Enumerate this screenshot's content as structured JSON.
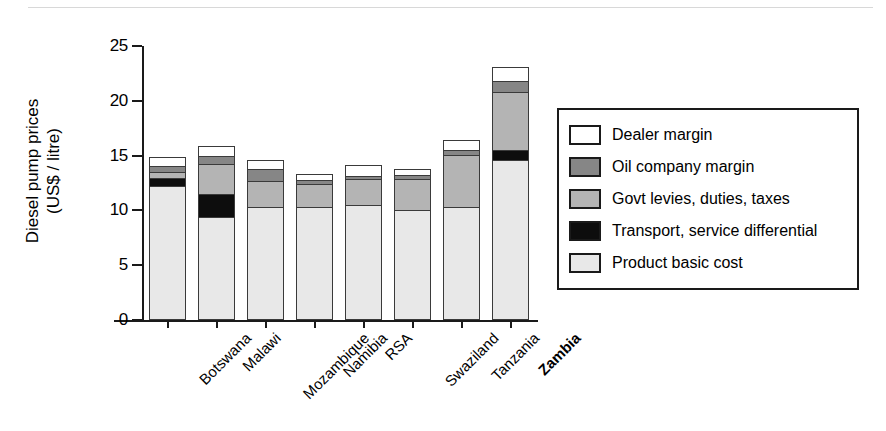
{
  "chart_data": {
    "type": "bar",
    "subtype": "stacked-bar",
    "title": "",
    "xlabel": "",
    "ylabel": "Diesel pump prices (US$ / litre)",
    "ylabel_line1": "Diesel pump prices",
    "ylabel_line2": "(US$ / litre)",
    "ylim": [
      0,
      25
    ],
    "yticks": [
      0,
      5,
      10,
      15,
      20,
      25
    ],
    "ytick_labels": [
      "0",
      "5",
      "10",
      "15",
      "20",
      "25"
    ],
    "grid": false,
    "legend_position": "right",
    "categories": [
      "Botswana",
      "Malawi",
      "Mozambique",
      "Namibia",
      "RSA",
      "Swaziland",
      "Tanzania",
      "Zambia"
    ],
    "highlighted_category": "Zambia",
    "series": [
      {
        "name": "Product basic cost",
        "key": "product",
        "color": "#e8e8e8",
        "values": [
          12.2,
          9.4,
          10.35,
          10.3,
          10.5,
          10.0,
          10.3,
          14.6
        ]
      },
      {
        "name": "Transport, service differential",
        "key": "transport",
        "color": "#0d0d0d",
        "values": [
          0.75,
          2.1,
          0.0,
          0.0,
          0.0,
          0.0,
          0.0,
          0.9
        ]
      },
      {
        "name": "Govt levies, duties, taxes",
        "key": "govt",
        "color": "#b4b4b4",
        "values": [
          0.55,
          2.7,
          2.3,
          2.1,
          2.35,
          2.85,
          4.75,
          5.3
        ]
      },
      {
        "name": "Oil company margin",
        "key": "oil",
        "color": "#868686",
        "values": [
          0.55,
          0.8,
          1.15,
          0.35,
          0.3,
          0.4,
          0.45,
          1.0
        ]
      },
      {
        "name": "Dealer margin",
        "key": "dealer",
        "color": "#ffffff",
        "values": [
          0.8,
          0.9,
          0.8,
          0.6,
          1.0,
          0.5,
          0.9,
          1.3
        ]
      }
    ],
    "totals": [
      14.4,
      16.6,
      14.35,
      13.3,
      14.1,
      13.7,
      16.4,
      23.1
    ]
  },
  "legend": {
    "items": [
      {
        "label": "Dealer margin",
        "key": "dealer"
      },
      {
        "label": "Oil company margin",
        "key": "oil"
      },
      {
        "label": "Govt levies, duties, taxes",
        "key": "govt"
      },
      {
        "label": "Transport, service differential",
        "key": "transport"
      },
      {
        "label": "Product basic cost",
        "key": "product"
      }
    ]
  }
}
